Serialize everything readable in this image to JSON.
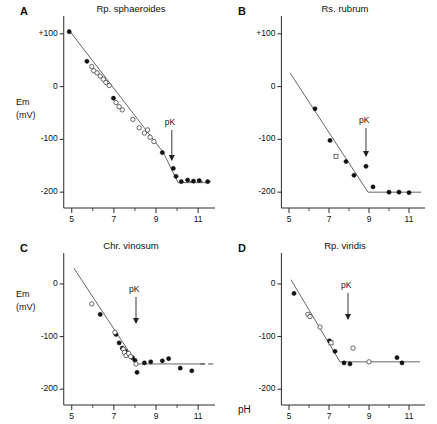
{
  "figure": {
    "xaxis_title": "pH",
    "yaxis_title_line1": "Em",
    "yaxis_title_line2": "(mV)"
  },
  "chart_data": [
    {
      "type": "scatter",
      "panel": "A",
      "title": "Rp. sphaeroides",
      "xlabel": "pH",
      "ylabel": "Em (mV)",
      "xlim": [
        4.3,
        11.8
      ],
      "ylim": [
        -230,
        130
      ],
      "xticks": [
        5,
        7,
        9,
        11
      ],
      "ytick_values": [
        100,
        0,
        -100,
        -200
      ],
      "ytick_labels": [
        "+100",
        "0",
        "-100",
        "-200"
      ],
      "grid": false,
      "annotation": "pK",
      "annotation_x": 9.75,
      "fit_line": [
        [
          4.85,
          108
        ],
        [
          9.35,
          -125
        ],
        [
          10.05,
          -182
        ],
        [
          11.55,
          -182
        ]
      ],
      "dashed_line": [
        [
          10.6,
          -180
        ],
        [
          11.7,
          -180
        ]
      ],
      "series": [
        {
          "name": "filled-circles",
          "marker": "filled-circle",
          "points": [
            [
              4.88,
              104
            ],
            [
              5.72,
              48
            ],
            [
              6.98,
              -22
            ],
            [
              9.3,
              -125
            ],
            [
              9.82,
              -155
            ],
            [
              9.95,
              -170
            ],
            [
              10.2,
              -180
            ],
            [
              10.5,
              -177
            ],
            [
              10.78,
              -179
            ],
            [
              11.05,
              -178
            ],
            [
              11.45,
              -180
            ]
          ]
        },
        {
          "name": "open-circles",
          "marker": "open-circle",
          "points": [
            [
              5.95,
              38
            ],
            [
              6.05,
              30
            ],
            [
              6.2,
              26
            ],
            [
              6.35,
              20
            ],
            [
              6.5,
              14
            ],
            [
              6.62,
              8
            ],
            [
              6.78,
              2
            ],
            [
              7.1,
              -30
            ],
            [
              7.25,
              -38
            ],
            [
              7.4,
              -44
            ],
            [
              7.9,
              -62
            ],
            [
              8.2,
              -78
            ],
            [
              8.45,
              -88
            ],
            [
              8.6,
              -82
            ],
            [
              8.72,
              -96
            ],
            [
              8.9,
              -104
            ]
          ]
        }
      ]
    },
    {
      "type": "scatter",
      "panel": "B",
      "title": "Rs. rubrum",
      "xlabel": "pH",
      "ylabel": "Em (mV)",
      "xlim": [
        4.3,
        11.8
      ],
      "ylim": [
        -230,
        130
      ],
      "xticks": [
        5,
        7,
        9,
        11
      ],
      "ytick_values": [
        100,
        0,
        -100,
        -200
      ],
      "ytick_labels": [
        "+100",
        "0",
        "-100",
        "-200"
      ],
      "grid": false,
      "annotation": "pK",
      "annotation_x": 8.85,
      "fit_line": [
        [
          5.05,
          26
        ],
        [
          8.95,
          -200
        ],
        [
          11.6,
          -200
        ]
      ],
      "series": [
        {
          "name": "filled-circles",
          "marker": "filled-circle",
          "points": [
            [
              6.3,
              -42
            ],
            [
              7.05,
              -102
            ],
            [
              7.85,
              -142
            ],
            [
              8.25,
              -168
            ],
            [
              8.85,
              -151
            ],
            [
              9.2,
              -190
            ],
            [
              10.0,
              -200
            ],
            [
              10.5,
              -200
            ],
            [
              11.0,
              -201
            ]
          ]
        },
        {
          "name": "open-squares",
          "marker": "open-square",
          "points": [
            [
              7.35,
              -132
            ]
          ]
        }
      ]
    },
    {
      "type": "scatter",
      "panel": "C",
      "title": "Chr. vinosum",
      "xlabel": "pH",
      "ylabel": "Em (mV)",
      "xlim": [
        4.3,
        11.8
      ],
      "ylim": [
        -230,
        55
      ],
      "xticks": [
        5,
        7,
        9,
        11
      ],
      "ytick_values": [
        0,
        -100,
        -200
      ],
      "ytick_labels": [
        "0",
        "-100",
        "-200"
      ],
      "grid": false,
      "annotation": "pK",
      "annotation_x": 8.05,
      "fit_line": [
        [
          5.1,
          30
        ],
        [
          7.9,
          -140
        ],
        [
          8.15,
          -152
        ],
        [
          11.3,
          -152
        ]
      ],
      "dashed_line": [
        [
          11.1,
          -152
        ],
        [
          11.75,
          -152
        ]
      ],
      "series": [
        {
          "name": "filled-circles",
          "marker": "filled-circle",
          "points": [
            [
              6.35,
              -58
            ],
            [
              7.1,
              -96
            ],
            [
              7.25,
              -112
            ],
            [
              7.4,
              -122
            ],
            [
              7.55,
              -128
            ],
            [
              7.62,
              -134
            ],
            [
              7.88,
              -140
            ],
            [
              8.0,
              -145
            ],
            [
              8.1,
              -168
            ],
            [
              8.45,
              -150
            ],
            [
              8.75,
              -148
            ],
            [
              9.3,
              -146
            ],
            [
              9.6,
              -142
            ],
            [
              10.15,
              -160
            ],
            [
              10.7,
              -165
            ]
          ]
        },
        {
          "name": "open-circles",
          "marker": "open-circle",
          "points": [
            [
              5.95,
              -38
            ],
            [
              7.05,
              -92
            ],
            [
              7.45,
              -124
            ],
            [
              7.5,
              -130
            ],
            [
              7.58,
              -136
            ],
            [
              7.7,
              -132
            ],
            [
              7.8,
              -138
            ],
            [
              8.05,
              -152
            ]
          ]
        }
      ]
    },
    {
      "type": "scatter",
      "panel": "D",
      "title": "Rp. viridis",
      "xlabel": "pH",
      "ylabel": "Em (mV)",
      "xlim": [
        4.3,
        11.8
      ],
      "ylim": [
        -230,
        55
      ],
      "xticks": [
        5,
        7,
        9,
        11
      ],
      "ytick_values": [
        0,
        -100,
        -200
      ],
      "ytick_labels": [
        "0",
        "-100",
        "-200"
      ],
      "grid": false,
      "annotation": "pK",
      "annotation_x": 7.95,
      "fit_line": [
        [
          5.1,
          8
        ],
        [
          7.55,
          -148
        ],
        [
          11.55,
          -148
        ]
      ],
      "series": [
        {
          "name": "filled-circles",
          "marker": "filled-circle",
          "points": [
            [
              5.25,
              -18
            ],
            [
              7.02,
              -108
            ],
            [
              7.3,
              -128
            ],
            [
              7.75,
              -150
            ],
            [
              8.05,
              -152
            ],
            [
              10.4,
              -140
            ],
            [
              10.65,
              -150
            ]
          ]
        },
        {
          "name": "open-circles",
          "marker": "open-circle",
          "points": [
            [
              5.95,
              -58
            ],
            [
              6.05,
              -62
            ],
            [
              6.55,
              -82
            ],
            [
              8.2,
              -122
            ],
            [
              9.0,
              -148
            ]
          ]
        },
        {
          "name": "open-squares",
          "marker": "open-square",
          "points": [
            [
              7.1,
              -112
            ]
          ]
        }
      ]
    }
  ]
}
